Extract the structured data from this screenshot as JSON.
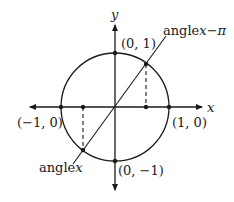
{
  "diagram": {
    "type": "unit-circle",
    "axes": {
      "x_label": "x",
      "y_label": "y"
    },
    "points": {
      "top": "(0, 1)",
      "bottom": "(0, −1)",
      "left": "(−1, 0)",
      "right": "(1, 0)"
    },
    "angle_labels": {
      "angle_x_word": "angle",
      "angle_x_var": "x",
      "angle_x_minus_pi_word": "angle",
      "angle_x_minus_pi_var": "x−π"
    },
    "colors": {
      "stroke": "#1a1a1a",
      "background": "#ffffff"
    }
  }
}
